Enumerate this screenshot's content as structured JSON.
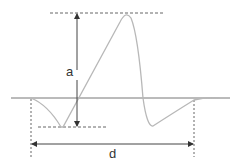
{
  "diagram": {
    "labels": {
      "amplitude": "a",
      "duration": "d"
    },
    "colors": {
      "curve": "#b8b8b8",
      "lines": "#555555",
      "baseline": "#777777"
    }
  }
}
